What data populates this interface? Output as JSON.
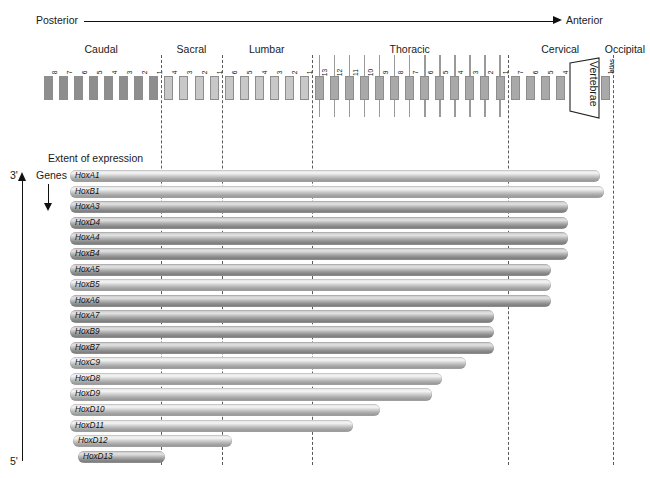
{
  "figure": {
    "axis": {
      "left_label": "Posterior",
      "right_label": "Anterior"
    },
    "left_axis": {
      "three_prime": "3'",
      "five_prime": "5'",
      "genes_label": "Genes"
    },
    "extent_label": "Extent of expression",
    "vertebrae_bracket_label": "Vertebrae",
    "special_vertebra_labels": {
      "axis": "axis",
      "atlas": "atlas"
    },
    "regions": [
      {
        "name": "Caudal",
        "count": 8,
        "numbers": [
          "8",
          "7",
          "6",
          "5",
          "4",
          "3",
          "2",
          "1"
        ],
        "shade": "dark",
        "ribs": false
      },
      {
        "name": "Sacral",
        "count": 4,
        "numbers": [
          "4",
          "3",
          "2",
          "1"
        ],
        "shade": "light",
        "ribs": false
      },
      {
        "name": "Lumbar",
        "count": 6,
        "numbers": [
          "6",
          "5",
          "4",
          "3",
          "2",
          "1"
        ],
        "shade": "light",
        "ribs": false
      },
      {
        "name": "Thoracic",
        "count": 13,
        "numbers": [
          "13",
          "12",
          "11",
          "10",
          "9",
          "8",
          "7",
          "6",
          "5",
          "4",
          "3",
          "2",
          "1"
        ],
        "shade": "mid",
        "ribs": true
      },
      {
        "name": "Cervical",
        "count": 7,
        "numbers": [
          "7",
          "6",
          "5",
          "4",
          "3",
          "2",
          "1"
        ],
        "shade": "mid",
        "ribs": false
      },
      {
        "name": "Occipital",
        "count": 0,
        "numbers": [],
        "shade": "mid",
        "ribs": false
      }
    ],
    "genes": [
      {
        "name": "HoxA1",
        "start_px": 70,
        "end_px": 600,
        "dark": false
      },
      {
        "name": "HoxB1",
        "start_px": 70,
        "end_px": 604,
        "dark": false
      },
      {
        "name": "HoxA3",
        "start_px": 70,
        "end_px": 568,
        "dark": true
      },
      {
        "name": "HoxD4",
        "start_px": 70,
        "end_px": 568,
        "dark": true
      },
      {
        "name": "HoxA4",
        "start_px": 70,
        "end_px": 568,
        "dark": true
      },
      {
        "name": "HoxB4",
        "start_px": 70,
        "end_px": 568,
        "dark": true
      },
      {
        "name": "HoxA5",
        "start_px": 70,
        "end_px": 551,
        "dark": true
      },
      {
        "name": "HoxB5",
        "start_px": 70,
        "end_px": 551,
        "dark": false
      },
      {
        "name": "HoxA6",
        "start_px": 70,
        "end_px": 551,
        "dark": true
      },
      {
        "name": "HoxA7",
        "start_px": 70,
        "end_px": 494,
        "dark": true
      },
      {
        "name": "HoxB9",
        "start_px": 70,
        "end_px": 494,
        "dark": true
      },
      {
        "name": "HoxB7",
        "start_px": 70,
        "end_px": 494,
        "dark": true
      },
      {
        "name": "HoxC9",
        "start_px": 70,
        "end_px": 466,
        "dark": false
      },
      {
        "name": "HoxD8",
        "start_px": 70,
        "end_px": 442,
        "dark": false
      },
      {
        "name": "HoxD9",
        "start_px": 70,
        "end_px": 432,
        "dark": false
      },
      {
        "name": "HoxD10",
        "start_px": 70,
        "end_px": 380,
        "dark": false
      },
      {
        "name": "HoxD11",
        "start_px": 70,
        "end_px": 353,
        "dark": false
      },
      {
        "name": "HoxD12",
        "start_px": 73,
        "end_px": 232,
        "dark": false
      },
      {
        "name": "HoxD13",
        "start_px": 78,
        "end_px": 165,
        "dark": true
      }
    ]
  }
}
